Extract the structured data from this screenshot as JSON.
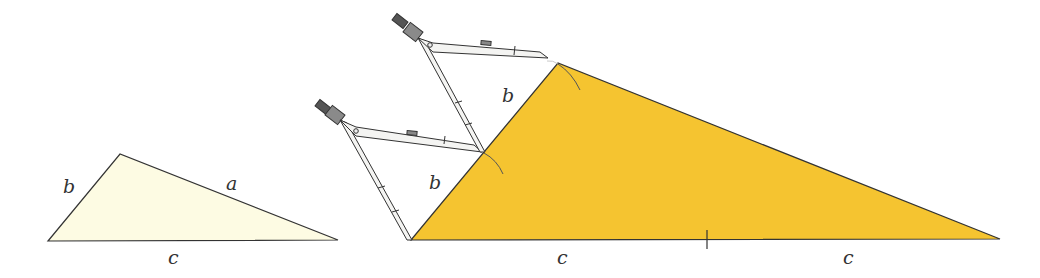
{
  "diagram": {
    "colors": {
      "small_fill": "#fdfbe3",
      "big_fill": "#f5c430",
      "stroke": "#333333",
      "compass_body": "#f4f4f2",
      "compass_head": "#8a8a8a"
    },
    "small_triangle": {
      "labels": {
        "left_side": "b",
        "right_side": "a",
        "base": "c"
      }
    },
    "big_triangle": {
      "labels": {
        "upper_left": "b",
        "lower_left": "b",
        "base_left": "c",
        "base_right": "c"
      }
    }
  }
}
